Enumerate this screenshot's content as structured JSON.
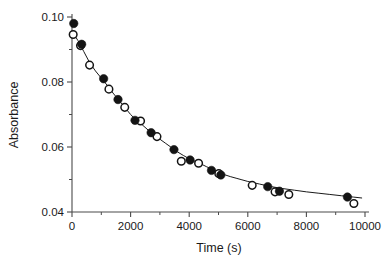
{
  "chart_data": {
    "type": "scatter",
    "title": "",
    "xlabel": "Time (s)",
    "ylabel": "Absorbance",
    "xlim": [
      0,
      10000
    ],
    "ylim": [
      0.04,
      0.1
    ],
    "grid": false,
    "legend": "none",
    "x_ticks": [
      0,
      2000,
      4000,
      6000,
      8000,
      10000
    ],
    "x_tick_labels": [
      "0",
      "2000",
      "4000",
      "6000",
      "8000",
      "10000"
    ],
    "x_minor_ticks": [
      1000,
      3000,
      5000,
      7000,
      9000
    ],
    "y_ticks": [
      0.04,
      0.06,
      0.08,
      0.1
    ],
    "y_tick_labels": [
      "0.04",
      "0.06",
      "0.08",
      "0.10"
    ],
    "y_minor_ticks": [
      0.05,
      0.07,
      0.09
    ],
    "series": [
      {
        "name": "filled-circles",
        "marker": "filled-circle",
        "color": "#141414",
        "points": [
          [
            60,
            0.098
          ],
          [
            330,
            0.0916
          ],
          [
            1080,
            0.081
          ],
          [
            1570,
            0.0746
          ],
          [
            2150,
            0.0682
          ],
          [
            2700,
            0.0644
          ],
          [
            3480,
            0.0592
          ],
          [
            4030,
            0.056
          ],
          [
            4760,
            0.0528
          ],
          [
            5080,
            0.0514
          ],
          [
            6680,
            0.0478
          ],
          [
            7080,
            0.0464
          ],
          [
            9400,
            0.0446
          ]
        ]
      },
      {
        "name": "open-circles",
        "marker": "open-circle",
        "color": "#141414",
        "points": [
          [
            40,
            0.0946
          ],
          [
            290,
            0.0912
          ],
          [
            600,
            0.0852
          ],
          [
            1260,
            0.0778
          ],
          [
            1800,
            0.0722
          ],
          [
            2340,
            0.068
          ],
          [
            2900,
            0.0632
          ],
          [
            3730,
            0.0556
          ],
          [
            4320,
            0.055
          ],
          [
            5010,
            0.0518
          ],
          [
            6150,
            0.0482
          ],
          [
            6930,
            0.0462
          ],
          [
            7400,
            0.0454
          ],
          [
            9620,
            0.0426
          ]
        ]
      }
    ],
    "fit_curve": {
      "name": "exponential-decay-fit",
      "color": "#1a1a1a",
      "points": [
        [
          40,
          0.095
        ],
        [
          200,
          0.0928
        ],
        [
          400,
          0.0894
        ],
        [
          600,
          0.086
        ],
        [
          800,
          0.0834
        ],
        [
          1000,
          0.0812
        ],
        [
          1200,
          0.079
        ],
        [
          1400,
          0.0766
        ],
        [
          1600,
          0.0744
        ],
        [
          1800,
          0.0722
        ],
        [
          2000,
          0.07
        ],
        [
          2200,
          0.0682
        ],
        [
          2400,
          0.0668
        ],
        [
          2600,
          0.0652
        ],
        [
          2800,
          0.0638
        ],
        [
          3000,
          0.0624
        ],
        [
          3200,
          0.0611
        ],
        [
          3400,
          0.0598
        ],
        [
          3600,
          0.0585
        ],
        [
          3800,
          0.0574
        ],
        [
          4000,
          0.0564
        ],
        [
          4200,
          0.0556
        ],
        [
          4400,
          0.0548
        ],
        [
          4600,
          0.0539
        ],
        [
          4800,
          0.0531
        ],
        [
          5000,
          0.0522
        ],
        [
          5200,
          0.0515
        ],
        [
          5400,
          0.0509
        ],
        [
          5600,
          0.0504
        ],
        [
          5800,
          0.0499
        ],
        [
          6000,
          0.0494
        ],
        [
          6400,
          0.0486
        ],
        [
          6800,
          0.0478
        ],
        [
          7200,
          0.0472
        ],
        [
          7600,
          0.0467
        ],
        [
          8000,
          0.0462
        ],
        [
          8400,
          0.0458
        ],
        [
          8800,
          0.0454
        ],
        [
          9200,
          0.045
        ],
        [
          9600,
          0.0446
        ],
        [
          9900,
          0.0443
        ]
      ]
    }
  }
}
